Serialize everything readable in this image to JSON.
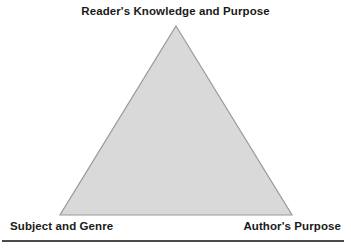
{
  "figure": {
    "title_label": "Reader's Knowledge and Purpose",
    "left_label": "Subject and Genre",
    "right_label": "Author's Purpose",
    "shape": "triangle",
    "fill_color": "#d9d9d9",
    "stroke_color": "#9a9a9a",
    "text_color": "#1a1a1a",
    "rule_color": "#4a4a4a",
    "background_color": "#ffffff",
    "vertices": {
      "apex": {
        "x": 176,
        "y": 26
      },
      "bottom_left": {
        "x": 60,
        "y": 215
      },
      "bottom_right": {
        "x": 292,
        "y": 215
      }
    }
  }
}
